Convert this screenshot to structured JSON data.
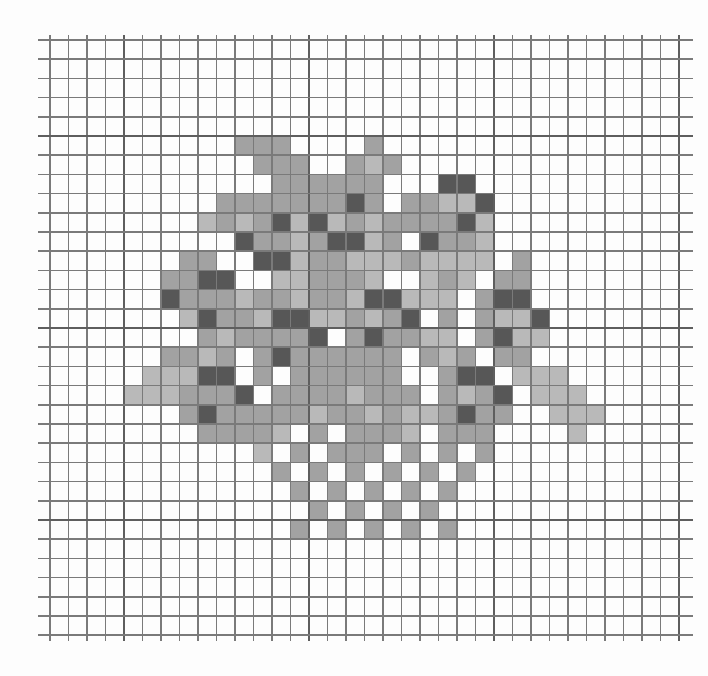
{
  "sheet": {
    "description": "Graph paper with hand-shaded grayscale pixel-art blob",
    "grid": {
      "columns": 34,
      "rows": 31,
      "origin_x": 50,
      "origin_y": 40,
      "cell_width": 18.5,
      "cell_height": 19.2,
      "major_every": 10,
      "major_col_offset": 4,
      "major_row_offset": 5,
      "line_overhang_left": 12,
      "line_overhang_right": 14,
      "line_overhang_top": 5,
      "line_overhang_bottom": 6
    },
    "colors": {
      "paper": "#fdfdfd",
      "minor_line": "#7a7a7a",
      "major_line": "#5e5e5e",
      "light": "#b9b9b9",
      "medium": "#a2a2a2",
      "dark": "#575757"
    },
    "legend": {
      ".": "blank",
      "L": "light shade",
      "M": "medium shade",
      "D": "dark shade"
    },
    "shaded_rows": [
      "..................................",
      "..................................",
      "..................................",
      "..................................",
      "..................................",
      "..........MMM....M................",
      "...........MMM..MLM...............",
      "............MMMMMM...DD...........",
      ".........MMMMMMMDM.MMLLD..........",
      "........LMLMDLDLMLMMMMDL..........",
      "..........DMMLMDDLM.DMML..........",
      ".......MM..DDLMMLLLMLLLL.M........",
      "......MMDD..LLMMML..LML.MM........",
      "......DMMMLMMLMMLDDLLL.MDD........",
      ".......LDMMLDDLLMLMD.M.MLLD.......",
      "........MLMMMMD.MDMMLL.MDLL.......",
      "......MMLM.MDMMMMMM.MLM.MM........",
      ".....LLLDD.M.MMMMMM..MDD.LLL......",
      "....LLLMMMD.MMMMLMMM.MLMD.LLL.....",
      ".......MDMMMMMLMMLMLLMDMM..LLL....",
      "........MMMML.M.MMML.MMM....L.....",
      "...........L.M.MMM.M.M.M..........",
      "............M.M.M.M.M.M...........",
      ".............M.M.M.M.M............",
      "..............M.M.M.M.............",
      ".............M.M.M.M.M............",
      "..................................",
      "..................................",
      "..................................",
      "..................................",
      ".................................."
    ]
  }
}
